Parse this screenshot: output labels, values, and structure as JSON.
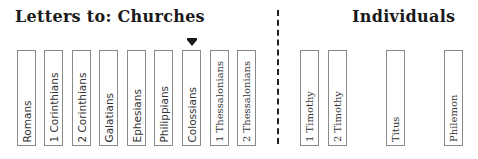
{
  "headings": {
    "churches": "Letters to:  Churches",
    "individuals": "Individuals"
  },
  "marker": {
    "icon": "down-arrow-marker",
    "points_to": "Colossians"
  },
  "churches": [
    {
      "label": "Romans"
    },
    {
      "label": "1 Corinthians"
    },
    {
      "label": "2 Corinthians"
    },
    {
      "label": "Galatians"
    },
    {
      "label": "Ephesians"
    },
    {
      "label": "Philippians"
    },
    {
      "label": "Colossians"
    },
    {
      "label": "1 Thessalonians"
    },
    {
      "label": "2 Thessalonians"
    }
  ],
  "individuals": [
    {
      "label": "1 Timothy"
    },
    {
      "label": "2 Timothy"
    },
    {
      "label": "Titus"
    },
    {
      "label": "Philemon"
    }
  ]
}
